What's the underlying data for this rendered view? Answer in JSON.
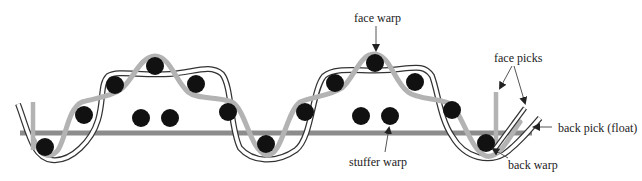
{
  "diagram": {
    "type": "woven fabric cross-section",
    "labels": {
      "face_warp": "face warp",
      "face_picks": "face picks",
      "back_pick": "back pick (float)",
      "stuffer_warp": "stuffer warp",
      "back_warp": "back warp"
    },
    "colors": {
      "face_warp": "#b3b3b3",
      "back_pick": "#8c8c8c",
      "picks": "#111111",
      "back_warp_outline": "#333333",
      "text": "#222222"
    },
    "picks_count": 17
  }
}
